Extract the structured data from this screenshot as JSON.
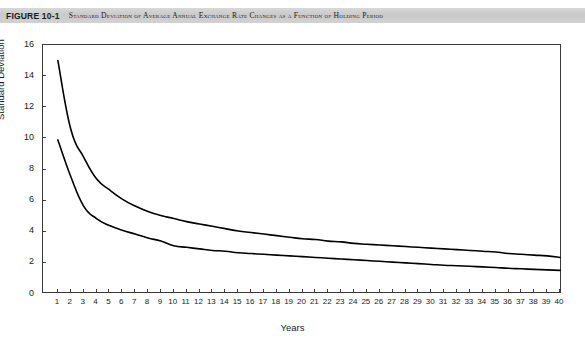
{
  "caption": {
    "figure_number": "FIGURE 10-1",
    "title": "Standard Deviation of Average Annual Exchange Rate Changes as a Function of Holding Period"
  },
  "chart_data": {
    "type": "line",
    "title": "Standard Deviation of Average Annual Exchange Rate Changes as a Function of Holding Period",
    "xlabel": "Years",
    "ylabel": "Standard Deviation",
    "xlim": [
      0,
      40
    ],
    "ylim": [
      0,
      16
    ],
    "grid": false,
    "legend": "none",
    "y_ticks": [
      0,
      2,
      4,
      6,
      8,
      10,
      12,
      14,
      16
    ],
    "x_ticks": [
      1,
      2,
      3,
      4,
      5,
      6,
      7,
      8,
      9,
      10,
      11,
      12,
      13,
      14,
      15,
      16,
      17,
      18,
      19,
      20,
      21,
      22,
      23,
      24,
      25,
      26,
      27,
      28,
      29,
      30,
      31,
      32,
      33,
      34,
      35,
      36,
      37,
      38,
      39,
      40
    ],
    "x": [
      1,
      2,
      3,
      4,
      5,
      6,
      7,
      8,
      9,
      10,
      11,
      12,
      13,
      14,
      15,
      16,
      17,
      18,
      19,
      20,
      21,
      22,
      23,
      24,
      25,
      26,
      27,
      28,
      29,
      30,
      31,
      32,
      33,
      34,
      35,
      36,
      37,
      38,
      39,
      40
    ],
    "series": [
      {
        "name": "Upper curve",
        "color": "#000000",
        "values": [
          15.0,
          10.6,
          8.8,
          7.4,
          6.7,
          6.1,
          5.65,
          5.3,
          5.05,
          4.85,
          4.65,
          4.5,
          4.35,
          4.2,
          4.05,
          3.95,
          3.85,
          3.75,
          3.65,
          3.55,
          3.5,
          3.4,
          3.35,
          3.25,
          3.2,
          3.15,
          3.1,
          3.05,
          3.0,
          2.95,
          2.9,
          2.85,
          2.8,
          2.75,
          2.7,
          2.6,
          2.55,
          2.5,
          2.45,
          2.35
        ]
      },
      {
        "name": "Lower curve",
        "color": "#000000",
        "values": [
          9.9,
          7.55,
          5.65,
          4.85,
          4.4,
          4.1,
          3.85,
          3.6,
          3.4,
          3.1,
          3.0,
          2.9,
          2.8,
          2.75,
          2.65,
          2.6,
          2.55,
          2.5,
          2.45,
          2.4,
          2.35,
          2.3,
          2.25,
          2.2,
          2.15,
          2.1,
          2.05,
          2.0,
          1.95,
          1.9,
          1.85,
          1.82,
          1.78,
          1.74,
          1.7,
          1.65,
          1.62,
          1.58,
          1.55,
          1.52
        ]
      }
    ]
  },
  "colors": {
    "banner": "#d0d0d0",
    "line": "#000000",
    "axis": "#3a3a3a",
    "text": "#1a1a1a",
    "background": "#ffffff"
  }
}
